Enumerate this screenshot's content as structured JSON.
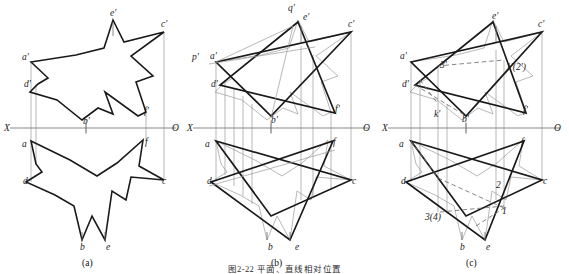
{
  "figure": {
    "caption": "图2-22  平面、直线相对位置",
    "panels": [
      {
        "id": "a",
        "caption": "(a)"
      },
      {
        "id": "b",
        "caption": "(b)"
      },
      {
        "id": "c",
        "caption": "(c)"
      }
    ]
  },
  "axis": {
    "x_label": "X",
    "o_label": "O"
  },
  "panel_a": {
    "labels": [
      {
        "name": "a-prime",
        "text": "a'",
        "x": 22,
        "y": 60
      },
      {
        "name": "d-prime",
        "text": "d'",
        "x": 24,
        "y": 87
      },
      {
        "name": "b-prime",
        "text": "b'",
        "x": 83,
        "y": 124
      },
      {
        "name": "e-prime",
        "text": "e'",
        "x": 110,
        "y": 16
      },
      {
        "name": "c-prime",
        "text": "c'",
        "x": 161,
        "y": 27
      },
      {
        "name": "f-prime",
        "text": "f'",
        "x": 144,
        "y": 114
      },
      {
        "name": "a-lower",
        "text": "a",
        "x": 22,
        "y": 147
      },
      {
        "name": "d-lower",
        "text": "d",
        "x": 23,
        "y": 184
      },
      {
        "name": "b-lower",
        "text": "b",
        "x": 80,
        "y": 244
      },
      {
        "name": "e-lower",
        "text": "e",
        "x": 106,
        "y": 244
      },
      {
        "name": "c-lower",
        "text": "c",
        "x": 162,
        "y": 184
      },
      {
        "name": "f-lower",
        "text": "f",
        "x": 145,
        "y": 145
      }
    ]
  },
  "panel_b": {
    "labels": [
      {
        "name": "p-prime",
        "text": "p'",
        "x": 7,
        "y": 60
      },
      {
        "name": "a-prime",
        "text": "a'",
        "x": 25,
        "y": 59
      },
      {
        "name": "d-prime",
        "text": "d'",
        "x": 26,
        "y": 87
      },
      {
        "name": "b-prime",
        "text": "b'",
        "x": 86,
        "y": 123
      },
      {
        "name": "q-prime",
        "text": "q'",
        "x": 105,
        "y": 11
      },
      {
        "name": "e-prime",
        "text": "e'",
        "x": 118,
        "y": 20
      },
      {
        "name": "c-prime",
        "text": "c'",
        "x": 163,
        "y": 27
      },
      {
        "name": "f-prime",
        "text": "f'",
        "x": 150,
        "y": 112
      },
      {
        "name": "a-lower",
        "text": "a",
        "x": 20,
        "y": 147
      },
      {
        "name": "d-lower",
        "text": "d",
        "x": 22,
        "y": 184
      },
      {
        "name": "b-lower",
        "text": "b",
        "x": 83,
        "y": 244
      },
      {
        "name": "e-lower",
        "text": "e",
        "x": 110,
        "y": 244
      },
      {
        "name": "c-lower",
        "text": "c",
        "x": 165,
        "y": 184
      },
      {
        "name": "f-lower",
        "text": "f",
        "x": 148,
        "y": 145
      }
    ]
  },
  "panel_c": {
    "labels": [
      {
        "name": "a-prime",
        "text": "a'",
        "x": 20,
        "y": 59
      },
      {
        "name": "d-prime",
        "text": "d'",
        "x": 22,
        "y": 87
      },
      {
        "name": "k-prime",
        "text": "k'",
        "x": 56,
        "y": 114
      },
      {
        "name": "three-prime",
        "text": "3'",
        "x": 62,
        "y": 66
      },
      {
        "name": "b-prime",
        "text": "b'",
        "x": 82,
        "y": 122
      },
      {
        "name": "e-prime",
        "text": "e'",
        "x": 112,
        "y": 19
      },
      {
        "name": "c-prime",
        "text": "c'",
        "x": 160,
        "y": 27
      },
      {
        "name": "one-two-prime",
        "text": "1'(2')",
        "x": 127,
        "y": 70
      },
      {
        "name": "f-prime",
        "text": "f'",
        "x": 143,
        "y": 113
      },
      {
        "name": "a-lower",
        "text": "a",
        "x": 19,
        "y": 147
      },
      {
        "name": "d-lower",
        "text": "d",
        "x": 21,
        "y": 184
      },
      {
        "name": "three-four",
        "text": "3(4)",
        "x": 47,
        "y": 216
      },
      {
        "name": "b-lower",
        "text": "b",
        "x": 80,
        "y": 244
      },
      {
        "name": "e-lower",
        "text": "e",
        "x": 106,
        "y": 244
      },
      {
        "name": "two-lower",
        "text": "2",
        "x": 118,
        "y": 186
      },
      {
        "name": "one-lower",
        "text": "1",
        "x": 122,
        "y": 210
      },
      {
        "name": "c-lower",
        "text": "c",
        "x": 163,
        "y": 184
      },
      {
        "name": "f-lower",
        "text": "f",
        "x": 143,
        "y": 145
      }
    ]
  },
  "geometry": {
    "axis_y": 128,
    "star_front": "31,62 48,78 38,84 30,92 57,100 82,120 98,108 113,114 105,92 138,116 146,112 136,82 153,76 131,56 164,32 124,42 113,20 104,48 76,55",
    "star_top": "31,141 70,160 97,176 117,163 143,140 139,166 164,180 131,177 126,200 112,191 105,240 92,216 82,240 74,206 55,195 26,182 42,172 36,164",
    "triangle_front_1": "31,62 164,32 86,116",
    "triangle_front_2": "113,20 150,113 35,85",
    "triangle_top_1": "31,141 164,180 86,216",
    "triangle_top_2": "105,240 148,141 26,182",
    "colors": {
      "outline": "#1a1a1a",
      "axis": "#8a8a8a",
      "projection": "#9a9a9a",
      "dashed": "#6f6f6f"
    }
  }
}
